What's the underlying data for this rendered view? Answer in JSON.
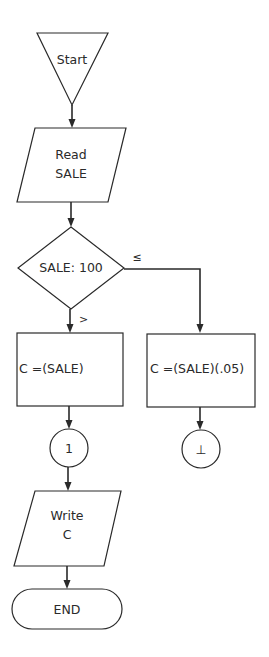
{
  "flowchart": {
    "start": {
      "label": "Start",
      "shape": "inverted-triangle"
    },
    "input": {
      "line1": "Read",
      "line2": "SALE",
      "shape": "parallelogram"
    },
    "decision": {
      "label": "SALE: 100",
      "shape": "diamond"
    },
    "branches": {
      "greater": {
        "symbol": ">",
        "process": "C =(SALE)",
        "connector": "1"
      },
      "less_equal": {
        "symbol": "≤",
        "process": "C =(SALE)(.05)",
        "connector": "⊥"
      }
    },
    "output": {
      "line1": "Write",
      "line2": "C",
      "shape": "parallelogram"
    },
    "end": {
      "label": "END",
      "shape": "terminal"
    }
  },
  "colors": {
    "stroke": "#2a2a2a",
    "background": "#ffffff"
  }
}
